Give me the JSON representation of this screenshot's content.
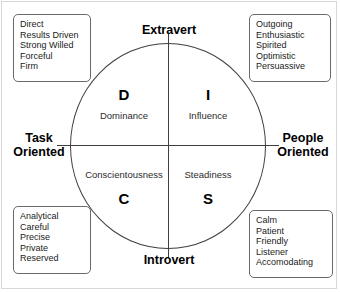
{
  "diagram": {
    "axes": {
      "top_label": "Extravert",
      "bottom_label": "Introvert",
      "left_label": "Task\nOriented",
      "left_label_line1": "Task",
      "left_label_line2": "Oriented",
      "right_label_line1": "People",
      "right_label_line2": "Oriented"
    },
    "quadrants": [
      {
        "key": "D",
        "letter": "D",
        "name": "Dominance",
        "position": "top-left",
        "traits": [
          "Direct",
          "Results Driven",
          "Strong Willed",
          "Forceful",
          "Firm"
        ]
      },
      {
        "key": "I",
        "letter": "I",
        "name": "Influence",
        "position": "top-right",
        "traits": [
          "Outgoing",
          "Enthusiastic",
          "Spirited",
          "Optimistic",
          "Persuassive"
        ]
      },
      {
        "key": "C",
        "letter": "C",
        "name": "Conscientousness",
        "position": "bottom-left",
        "traits": [
          "Analytical",
          "Careful",
          "Precise",
          "Private",
          "Reserved"
        ]
      },
      {
        "key": "S",
        "letter": "S",
        "name": "Steadiness",
        "position": "bottom-right",
        "traits": [
          "Calm",
          "Patient",
          "Friendly",
          "Listener",
          "Accomodating"
        ]
      }
    ],
    "colors": {
      "stroke": "#3f3f3f",
      "box_border": "#6a6a6a",
      "text": "#1a1a1a",
      "background": "#ffffff",
      "frame": "#d8d8d8"
    }
  }
}
